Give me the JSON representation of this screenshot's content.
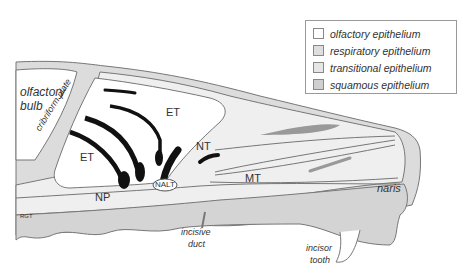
{
  "legend": {
    "items": [
      {
        "label": "olfactory epithelium",
        "color": "#ffffff"
      },
      {
        "label": "respiratory epithelium",
        "color": "#dedede"
      },
      {
        "label": "transitional epithelium",
        "color": "#e6e6e6"
      },
      {
        "label": "squamous epithelium",
        "color": "#cfcfcf"
      }
    ]
  },
  "labels": {
    "olfactory_bulb_1": "olfactory",
    "olfactory_bulb_2": "bulb",
    "cribriform_plate": "cribriform plate",
    "et_upper": "ET",
    "et_lower": "ET",
    "nt": "NT",
    "mt": "MT",
    "np": "NP",
    "nalt": "NALT",
    "rgt": "RGT",
    "incisive_duct_1": "incisive",
    "incisive_duct_2": "duct",
    "naris": "naris",
    "incisor_tooth_1": "incisor",
    "incisor_tooth_2": "tooth"
  }
}
